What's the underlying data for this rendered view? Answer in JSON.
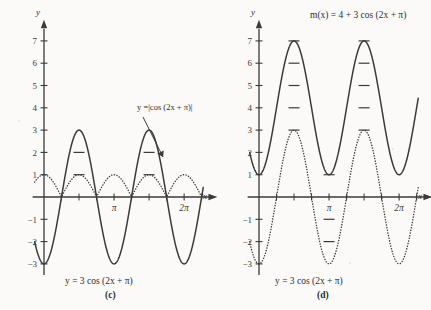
{
  "figure": {
    "background_color": "#fbfaf8",
    "ink_color": "#3a3a3a",
    "panels": [
      {
        "id": "c",
        "caption": "(c)",
        "bottom_equation": "y = 3 cos (2x + π)",
        "annotation_label": "y =|cos (2x + π)|",
        "axis_x_label": "x",
        "axis_y_label": "y",
        "y_ticks": [
          "7",
          "6",
          "5",
          "4",
          "3",
          "2",
          "1",
          "−1",
          "−2",
          "−3"
        ],
        "x_ticks": [
          "π",
          "2π"
        ]
      },
      {
        "id": "d",
        "caption": "(d)",
        "top_equation": "m(x) = 4 + 3 cos (2x + π)",
        "bottom_equation": "y = 3 cos (2x + π)",
        "axis_x_label": "x",
        "axis_y_label": "y",
        "y_ticks": [
          "7",
          "6",
          "5",
          "4",
          "3",
          "2",
          "1",
          "−1",
          "−2",
          "−3"
        ],
        "x_ticks": [
          "π",
          "2π"
        ]
      }
    ]
  },
  "chart_data": [
    {
      "type": "line",
      "panel": "c",
      "title": "",
      "xlabel": "x",
      "ylabel": "y",
      "xlim": [
        -0.45,
        7.3
      ],
      "ylim": [
        -3.6,
        7.6
      ],
      "grid": false,
      "legend": "inline-annotation",
      "x_tick_values": [
        3.14159,
        6.28319
      ],
      "x_tick_labels": [
        "π",
        "2π"
      ],
      "x_minor_tick_values": [
        0.7854,
        1.5708,
        2.35619,
        3.92699,
        4.71239,
        5.49779
      ],
      "y_tick_values": [
        -3,
        -2,
        -1,
        1,
        2,
        3,
        4,
        5,
        6,
        7
      ],
      "y_tick_labels": [
        "−3",
        "−2",
        "−1",
        "1",
        "2",
        "3",
        "4",
        "5",
        "6",
        "7"
      ],
      "series": [
        {
          "name": "y = 3 cos (2x + π)",
          "style": "solid",
          "formula": "3*cos(2*x + pi)",
          "amplitude": 3,
          "period": 3.14159,
          "midline": 0,
          "max": 3,
          "min": -3,
          "maxima_x": [
            1.5708,
            4.71239
          ],
          "minima_x": [
            0,
            3.14159,
            6.28319
          ],
          "zeros_x": [
            0.7854,
            2.35619,
            3.92699,
            5.49779
          ]
        },
        {
          "name": "y =|cos (2x + π)|",
          "style": "dotted",
          "formula": "abs(cos(2*x + pi))",
          "amplitude": 1,
          "period": 1.5708,
          "midline": 0.5,
          "max": 1,
          "min": 0,
          "maxima_x": [
            0,
            1.5708,
            3.14159,
            4.71239,
            6.28319
          ],
          "minima_x": [
            0.7854,
            2.35619,
            3.92699,
            5.49779
          ]
        }
      ]
    },
    {
      "type": "line",
      "panel": "d",
      "title": "m(x) = 4 + 3 cos (2x + π)",
      "xlabel": "x",
      "ylabel": "y",
      "xlim": [
        -0.45,
        7.3
      ],
      "ylim": [
        -3.6,
        7.6
      ],
      "grid": false,
      "legend": "inline-annotation",
      "x_tick_values": [
        3.14159,
        6.28319
      ],
      "x_tick_labels": [
        "π",
        "2π"
      ],
      "x_minor_tick_values": [
        0.7854,
        1.5708,
        2.35619,
        3.92699,
        4.71239,
        5.49779
      ],
      "y_tick_values": [
        -3,
        -2,
        -1,
        1,
        2,
        3,
        4,
        5,
        6,
        7
      ],
      "y_tick_labels": [
        "−3",
        "−2",
        "−1",
        "1",
        "2",
        "3",
        "4",
        "5",
        "6",
        "7"
      ],
      "series": [
        {
          "name": "m(x) = 4 + 3 cos (2x + π)",
          "style": "solid",
          "formula": "4 + 3*cos(2*x + pi)",
          "amplitude": 3,
          "period": 3.14159,
          "midline": 4,
          "max": 7,
          "min": 1,
          "maxima_x": [
            1.5708,
            4.71239
          ],
          "minima_x": [
            0,
            3.14159,
            6.28319
          ]
        },
        {
          "name": "y = 3 cos (2x + π)",
          "style": "dotted",
          "formula": "3*cos(2*x + pi)",
          "amplitude": 3,
          "period": 3.14159,
          "midline": 0,
          "max": 3,
          "min": -3,
          "maxima_x": [
            1.5708,
            4.71239
          ],
          "minima_x": [
            0,
            3.14159,
            6.28319
          ],
          "zeros_x": [
            0.7854,
            2.35619,
            3.92699,
            5.49779
          ]
        }
      ]
    }
  ]
}
